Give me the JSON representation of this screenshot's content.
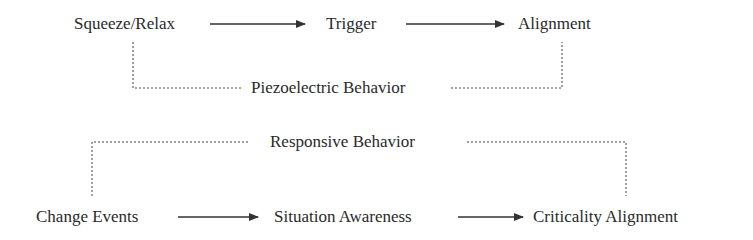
{
  "diagram": {
    "top_flow": {
      "nodes": [
        {
          "id": "squeeze",
          "label": "Squeeze/Relax"
        },
        {
          "id": "trigger",
          "label": "Trigger"
        },
        {
          "id": "alignment",
          "label": "Alignment"
        }
      ],
      "edges": [
        {
          "from": "squeeze",
          "to": "trigger",
          "style": "solid-arrow"
        },
        {
          "from": "trigger",
          "to": "alignment",
          "style": "solid-arrow"
        }
      ],
      "bracket_label": "Piezoelectric Behavior",
      "bracket_style": "dotted"
    },
    "bottom_flow": {
      "nodes": [
        {
          "id": "change",
          "label": "Change Events"
        },
        {
          "id": "situation",
          "label": "Situation Awareness"
        },
        {
          "id": "criticality",
          "label": "Criticality Alignment"
        }
      ],
      "edges": [
        {
          "from": "change",
          "to": "situation",
          "style": "solid-arrow"
        },
        {
          "from": "situation",
          "to": "criticality",
          "style": "solid-arrow"
        }
      ],
      "bracket_label": "Responsive Behavior",
      "bracket_style": "dotted"
    },
    "colors": {
      "text": "#2a2a2a",
      "line": "#333333",
      "background": "#ffffff"
    }
  }
}
